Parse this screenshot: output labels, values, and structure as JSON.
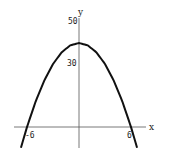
{
  "chart_data": {
    "type": "line",
    "title": "",
    "xlabel": "x",
    "ylabel": "y",
    "function": "y = 40 - (10/9) x^2",
    "x": [
      -6.7,
      -6,
      -5,
      -4,
      -3,
      -2,
      -1,
      0,
      1,
      2,
      3,
      4,
      5,
      6,
      6.7
    ],
    "series": [
      {
        "name": "parabola",
        "values": [
          -9.9,
          0,
          12.2,
          22.2,
          30,
          35.6,
          38.9,
          40,
          38.9,
          35.6,
          30,
          22.2,
          12.2,
          0,
          -9.9
        ]
      }
    ],
    "x_ticks": [
      {
        "value": -6,
        "label": "-6"
      },
      {
        "value": 6,
        "label": "6"
      }
    ],
    "y_ticks": [
      {
        "value": 30,
        "label": "30"
      },
      {
        "value": 50,
        "label": "50"
      }
    ],
    "xlim": [
      -7.5,
      7.5
    ],
    "ylim": [
      -10,
      52
    ],
    "grid": false,
    "legend": "none"
  },
  "labels": {
    "x_axis": "x",
    "y_axis": "y",
    "x_tick_neg": "-6",
    "x_tick_pos": "6",
    "y_tick_30": "30",
    "y_tick_50": "50"
  }
}
